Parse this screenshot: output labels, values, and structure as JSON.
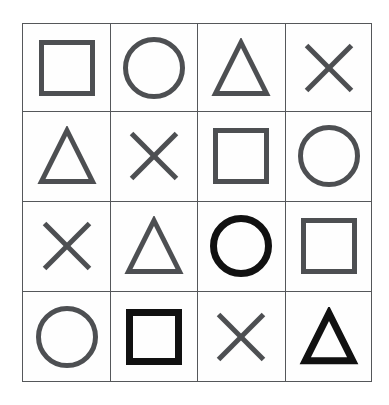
{
  "figure": {
    "name": "shape-matrix-grid",
    "type": "4x4 symbol grid",
    "rows": 4,
    "columns": 4,
    "background_color": "#ffffff",
    "grid_line_color": "#55575a",
    "normal_shape_color": "#4d4f52",
    "emphasized_shape_color": "#111111",
    "normal_stroke_width": 5,
    "emphasized_stroke_width": 7
  },
  "grid": {
    "x": 22,
    "y": 23,
    "width": 350,
    "height": 359,
    "column_edges": [
      0,
      87,
      174,
      262,
      350
    ],
    "row_edges": [
      0,
      87,
      177,
      267,
      359
    ]
  },
  "cells": [
    {
      "row": 1,
      "col": 1,
      "shape": "square",
      "emphasis": "normal",
      "color": "#4d4f52",
      "size": 56
    },
    {
      "row": 1,
      "col": 2,
      "shape": "circle",
      "emphasis": "normal",
      "color": "#4d4f52",
      "size": 62
    },
    {
      "row": 1,
      "col": 3,
      "shape": "triangle",
      "emphasis": "normal",
      "color": "#4d4f52",
      "size": 60
    },
    {
      "row": 1,
      "col": 4,
      "shape": "cross",
      "emphasis": "normal",
      "color": "#4d4f52",
      "size": 52
    },
    {
      "row": 2,
      "col": 1,
      "shape": "triangle",
      "emphasis": "normal",
      "color": "#4d4f52",
      "size": 60
    },
    {
      "row": 2,
      "col": 2,
      "shape": "cross",
      "emphasis": "normal",
      "color": "#4d4f52",
      "size": 52
    },
    {
      "row": 2,
      "col": 3,
      "shape": "square",
      "emphasis": "normal",
      "color": "#4d4f52",
      "size": 56
    },
    {
      "row": 2,
      "col": 4,
      "shape": "circle",
      "emphasis": "normal",
      "color": "#4d4f52",
      "size": 62
    },
    {
      "row": 3,
      "col": 1,
      "shape": "cross",
      "emphasis": "normal",
      "color": "#4d4f52",
      "size": 52
    },
    {
      "row": 3,
      "col": 2,
      "shape": "triangle",
      "emphasis": "normal",
      "color": "#4d4f52",
      "size": 60
    },
    {
      "row": 3,
      "col": 3,
      "shape": "circle",
      "emphasis": "emphasized",
      "color": "#111111",
      "size": 62
    },
    {
      "row": 3,
      "col": 4,
      "shape": "square",
      "emphasis": "normal",
      "color": "#4d4f52",
      "size": 56
    },
    {
      "row": 4,
      "col": 1,
      "shape": "circle",
      "emphasis": "normal",
      "color": "#4d4f52",
      "size": 62
    },
    {
      "row": 4,
      "col": 2,
      "shape": "square",
      "emphasis": "emphasized",
      "color": "#111111",
      "size": 56
    },
    {
      "row": 4,
      "col": 3,
      "shape": "cross",
      "emphasis": "normal",
      "color": "#4d4f52",
      "size": 52
    },
    {
      "row": 4,
      "col": 4,
      "shape": "triangle",
      "emphasis": "emphasized",
      "color": "#111111",
      "size": 60
    }
  ],
  "shape_labels": {
    "square": "square",
    "circle": "circle",
    "triangle": "triangle",
    "cross": "cross"
  }
}
